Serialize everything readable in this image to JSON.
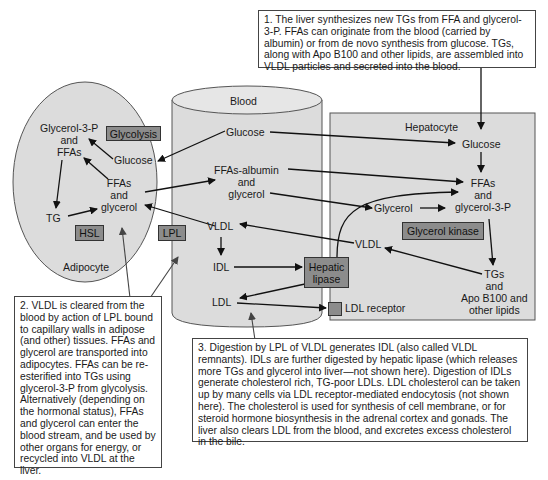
{
  "compartments": {
    "adipocyte": "Adipocyte",
    "blood": "Blood",
    "hepatocyte": "Hepatocyte"
  },
  "adipocyte": {
    "glycerol3p_ffas": [
      "Glycerol-3-P",
      "and",
      "FFAs"
    ],
    "glucose": "Glucose",
    "ffas_glycerol": [
      "FFAs",
      "and",
      "glycerol"
    ],
    "tg": "TG",
    "enzymes": {
      "glycolysis": "Glycolysis",
      "hsl": "HSL"
    }
  },
  "blood": {
    "glucose": "Glucose",
    "ffas_albumin": [
      "FFAs-albumin",
      "and",
      "glycerol"
    ],
    "vldl": "VLDL",
    "idl": "IDL",
    "ldl": "LDL",
    "enzymes": {
      "lpl": "LPL",
      "hepatic_lipase": [
        "Hepatic",
        "lipase"
      ]
    },
    "ldl_receptor": "LDL receptor"
  },
  "hepatocyte": {
    "glucose": "Glucose",
    "ffas_glycerol3p": [
      "FFAs",
      "and",
      "glycerol-3-P"
    ],
    "glycerol": "Glycerol",
    "vldl": "VLDL",
    "tgs": [
      "TGs",
      "and",
      "Apo B100 and",
      "other lipids"
    ],
    "enzymes": {
      "glycerol_kinase": "Glycerol kinase"
    }
  },
  "notes": {
    "note1": "1. The liver synthesizes new TGs from FFA and glycerol-3-P. FFAs can originate from the blood (carried by albumin) or from de novo synthesis from glucose. TGs, along with Apo B100 and other lipids, are assembled into VLDL particles and secreted into the blood.",
    "note2": "2. VLDL is cleared from the blood by action of LPL bound to capillary walls in adipose (and other) tissues. FFAs and glycerol are transported into adipocytes. FFAs can be re-esterified into TGs using glycerol-3-P from glycolysis. Alternatively (depending on the hormonal status), FFAs and glycerol can enter the blood stream, and be used by other organs for energy, or recycled into VLDL at the liver.",
    "note3": "3. Digestion by LPL of VLDL generates IDL (also called VLDL remnants). IDLs are further digested by hepatic lipase (which releases more TGs and glycerol into liver—not shown here). Digestion of IDLs generate cholesterol rich, TG-poor LDLs. LDL cholesterol can be taken up by many cells via LDL receptor-mediated endocytosis (not shown here). The cholesterol is used for synthesis of cell membrane, or for steroid hormone biosynthesis in the adrenal cortex and gonads. The liver also clears LDL from the blood, and excretes excess cholesterol in the bile."
  },
  "colors": {
    "compartment_fill": "#dcdcdc",
    "enzyme_fill": "#8c8c8c",
    "outline": "#444444",
    "arrow": "#111111"
  }
}
